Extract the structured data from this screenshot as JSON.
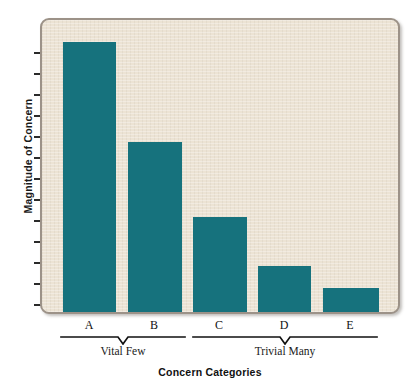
{
  "chart_data": {
    "type": "bar",
    "title": "",
    "subtitle": "",
    "xlabel": "Concern Categories",
    "ylabel": "Magnitude of Concern",
    "categories": [
      "A",
      "B",
      "C",
      "D",
      "E"
    ],
    "values": [
      100,
      63,
      35,
      17,
      9
    ],
    "ylim": [
      0,
      108
    ],
    "grid": false,
    "legend": null,
    "axis": {
      "y_tick_count": 13,
      "y_tick_labels": [],
      "x_tick_labels": [
        "A",
        "B",
        "C",
        "D",
        "E"
      ]
    },
    "annotations": [
      {
        "label": "Vital Few",
        "categories": [
          "A",
          "B"
        ]
      },
      {
        "label": "Trivial Many",
        "categories": [
          "C",
          "D",
          "E"
        ]
      }
    ],
    "series": [
      {
        "name": "Magnitude of Concern",
        "color": "#16727d",
        "values": [
          100,
          63,
          35,
          17,
          9
        ]
      }
    ]
  },
  "colors": {
    "bar": "#16727d",
    "panel_background": "#ece3d4",
    "panel_border": "#9c9288",
    "text": "#111111",
    "page_background": "#ffffff"
  },
  "labels": {
    "y_axis_title": "Magnitude of Concern",
    "x_axis_title": "Concern Categories",
    "categories": [
      "A",
      "B",
      "C",
      "D",
      "E"
    ],
    "group_vital_few": "Vital Few",
    "group_trivial_many": "Trivial Many"
  }
}
